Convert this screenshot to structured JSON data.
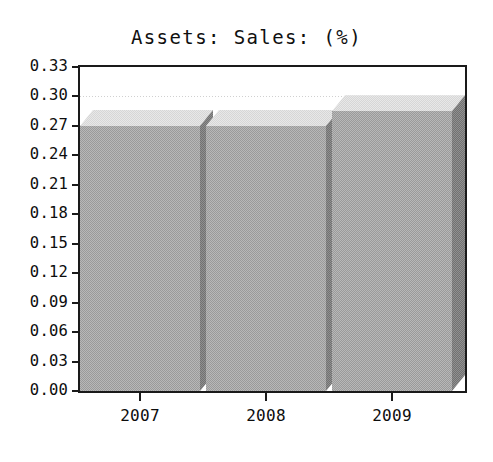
{
  "chart_data": {
    "type": "bar",
    "title": "Assets: Sales: (%)",
    "xlabel": "",
    "ylabel": "",
    "categories": [
      "2007",
      "2008",
      "2009"
    ],
    "values": [
      0.27,
      0.27,
      0.285
    ],
    "series": [
      {
        "name": "Assets: Sales: (%)",
        "values": [
          0.27,
          0.27,
          0.285
        ]
      }
    ],
    "ylim": [
      0.0,
      0.33
    ],
    "ytick_step": 0.03,
    "ytick_labels": [
      "0.33",
      "0.30",
      "0.27",
      "0.24",
      "0.21",
      "0.18",
      "0.15",
      "0.12",
      "0.09",
      "0.06",
      "0.03",
      "0.00"
    ],
    "ytick_values": [
      0.33,
      0.3,
      0.27,
      0.24,
      0.21,
      0.18,
      0.15,
      0.12,
      0.09,
      0.06,
      0.03,
      0.0
    ],
    "xtick_labels": [
      "2007",
      "2008",
      "2009"
    ],
    "grid": true,
    "grid_axis": "y",
    "legend": false,
    "legend_position": "none",
    "style": "3d-bar",
    "colors": {
      "bar_front": "#9a9a9a",
      "bar_top": "#d6d6d6",
      "bar_side": "#717171",
      "axis": "#1a1a1a",
      "grid": "#c8c8c8",
      "background": "#ffffff",
      "text": "#0d0d0d"
    }
  }
}
